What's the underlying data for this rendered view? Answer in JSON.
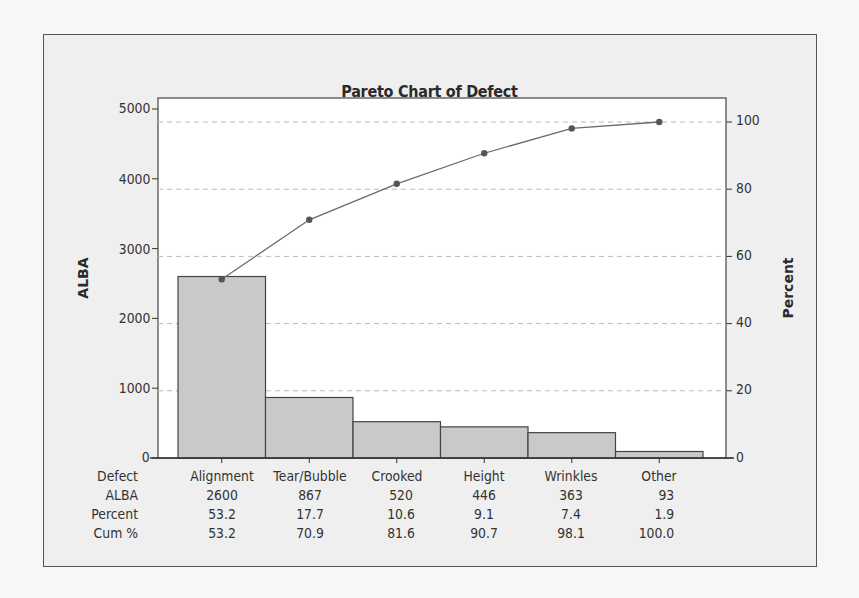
{
  "chart_data": {
    "type": "bar",
    "title": "Pareto Chart of Defect",
    "xlabel": "Defect",
    "ylabel": "ALBA",
    "y2label": "Percent",
    "categories": [
      "Alignment",
      "Tear/Bubble",
      "Crooked",
      "Height",
      "Wrinkles",
      "Other"
    ],
    "series": [
      {
        "name": "ALBA",
        "type": "bar",
        "axis": "left",
        "values": [
          2600,
          867,
          520,
          446,
          363,
          93
        ]
      },
      {
        "name": "Cum %",
        "type": "line",
        "axis": "right",
        "values": [
          53.2,
          70.9,
          81.6,
          90.7,
          98.1,
          100.0
        ]
      }
    ],
    "percent": [
      53.2,
      17.7,
      10.6,
      9.1,
      7.4,
      1.9
    ],
    "ylim": [
      0,
      5000
    ],
    "y2lim": [
      0,
      100
    ],
    "yticks": [
      0,
      1000,
      2000,
      3000,
      4000,
      5000
    ],
    "y2ticks": [
      0,
      20,
      40,
      60,
      80,
      100
    ],
    "grid": "dashed horizontal at right-axis ticks",
    "table": {
      "row_labels": [
        "Defect",
        "ALBA",
        "Percent",
        "Cum %"
      ],
      "rows": [
        [
          "Alignment",
          "Tear/Bubble",
          "Crooked",
          "Height",
          "Wrinkles",
          "Other"
        ],
        [
          "2600",
          "867",
          "520",
          "446",
          "363",
          "93"
        ],
        [
          "53.2",
          "17.7",
          "10.6",
          "9.1",
          "7.4",
          "1.9"
        ],
        [
          "53.2",
          "70.9",
          "81.6",
          "90.7",
          "98.1",
          "100.0"
        ]
      ]
    }
  },
  "colors": {
    "bar_fill": "#c9c9c9",
    "bar_stroke": "#444444",
    "line": "#6a6a6a",
    "marker": "#555555",
    "grid": "#bbbbbb",
    "frame_bg": "#efefef",
    "plot_bg": "#ffffff"
  }
}
